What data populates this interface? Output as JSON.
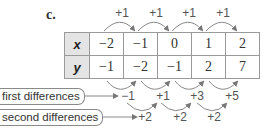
{
  "part_label": "c.",
  "table": {
    "rows": [
      {
        "header": "x",
        "values": [
          "−2",
          "−1",
          "0",
          "1",
          "2"
        ]
      },
      {
        "header": "y",
        "values": [
          "−1",
          "−2",
          "−1",
          "2",
          "7"
        ]
      }
    ]
  },
  "x_steps": [
    "+1",
    "+1",
    "+1",
    "+1"
  ],
  "first_differences": {
    "label": "first differences",
    "values": [
      "−1",
      "+1",
      "+3",
      "+5"
    ]
  },
  "second_differences": {
    "label": "second differences",
    "values": [
      "+2",
      "+2",
      "+2"
    ]
  },
  "colors": {
    "header_fill": "#e4e4e4",
    "border": "#9a9a9a",
    "arrow": "#777777",
    "text": "#333333"
  }
}
